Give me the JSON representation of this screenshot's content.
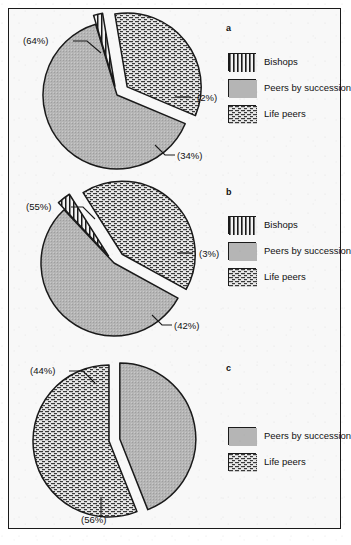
{
  "figure": {
    "panels": [
      {
        "id": "a",
        "letter": "a",
        "legend": [
          {
            "key": "bishops",
            "label": "Bishops",
            "pattern": "vertical-stripes"
          },
          {
            "key": "peers_by_succession",
            "label": "Peers by succession",
            "pattern": "solid-gray"
          },
          {
            "key": "life_peers",
            "label": "Life peers",
            "pattern": "brick-hatch"
          }
        ],
        "callouts": [
          {
            "key": "peers_by_succession",
            "text": "(64%)"
          },
          {
            "key": "bishops",
            "text": "(2%)"
          },
          {
            "key": "life_peers",
            "text": "(34%)"
          }
        ]
      },
      {
        "id": "b",
        "letter": "b",
        "legend": [
          {
            "key": "bishops",
            "label": "Bishops",
            "pattern": "vertical-stripes"
          },
          {
            "key": "peers_by_succession",
            "label": "Peers by succession",
            "pattern": "solid-gray"
          },
          {
            "key": "life_peers",
            "label": "Life peers",
            "pattern": "brick-hatch"
          }
        ],
        "callouts": [
          {
            "key": "peers_by_succession",
            "text": "(55%)"
          },
          {
            "key": "bishops",
            "text": "(3%)"
          },
          {
            "key": "life_peers",
            "text": "(42%)"
          }
        ]
      },
      {
        "id": "c",
        "letter": "c",
        "legend": [
          {
            "key": "peers_by_succession",
            "label": "Peers by succession",
            "pattern": "solid-gray"
          },
          {
            "key": "life_peers",
            "label": "Life peers",
            "pattern": "brick-hatch"
          }
        ],
        "callouts": [
          {
            "key": "peers_by_succession",
            "text": "(44%)"
          },
          {
            "key": "life_peers",
            "text": "(56%)"
          }
        ]
      }
    ]
  },
  "colors": {
    "gray_fill": "#b5b5b5",
    "hatch_fill": "#e8e8e8",
    "outline": "#1a1a1a",
    "background": "#f8f8f8"
  },
  "chart_data": [
    {
      "type": "pie",
      "title": "a",
      "categories": [
        "Peers by succession",
        "Bishops",
        "Life peers"
      ],
      "values": [
        64,
        2,
        34
      ],
      "labels": [
        "(64%)",
        "(2%)",
        "(34%)"
      ],
      "units": "percent",
      "exploded": [
        "Bishops",
        "Life peers"
      ],
      "legend_position": "right",
      "grid": false
    },
    {
      "type": "pie",
      "title": "b",
      "categories": [
        "Peers by succession",
        "Bishops",
        "Life peers"
      ],
      "values": [
        55,
        3,
        42
      ],
      "labels": [
        "(55%)",
        "(3%)",
        "(42%)"
      ],
      "units": "percent",
      "exploded": [
        "Bishops",
        "Life peers"
      ],
      "legend_position": "right",
      "grid": false
    },
    {
      "type": "pie",
      "title": "c",
      "categories": [
        "Peers by succession",
        "Life peers"
      ],
      "values": [
        44,
        56
      ],
      "labels": [
        "(44%)",
        "(56%)"
      ],
      "units": "percent",
      "exploded": [
        "Peers by succession"
      ],
      "legend_position": "right",
      "grid": false
    }
  ]
}
